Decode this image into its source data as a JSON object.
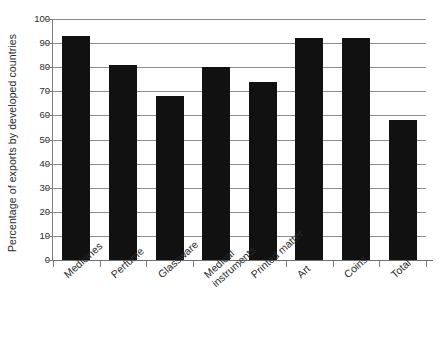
{
  "chart_data": {
    "type": "bar",
    "title": "",
    "xlabel": "",
    "ylabel": "Percentage of exports by developed countries",
    "categories": [
      "Medicines",
      "Perfume",
      "Glassware",
      "Medical instruments",
      "Printed matter",
      "Art",
      "Coins",
      "Total"
    ],
    "values": [
      93,
      81,
      68,
      80,
      74,
      92,
      92,
      58
    ],
    "ylim": [
      0,
      100
    ],
    "yticks": [
      0,
      10,
      20,
      30,
      40,
      50,
      60,
      70,
      80,
      90,
      100
    ],
    "ytick_labels": [
      "0",
      "10",
      "20",
      "30",
      "40",
      "50",
      "60",
      "70",
      "80",
      "90",
      "100"
    ],
    "grid": true,
    "legend": false,
    "legend_position": "none",
    "bar_color": "#111111",
    "grid_color": "#8f8f8f",
    "axis_color": "#7d7d7d",
    "text_color": "#2b2b2b",
    "x_label_rotation": -42
  },
  "axes": {
    "y_title": "Percentage of exports by developed countries"
  }
}
